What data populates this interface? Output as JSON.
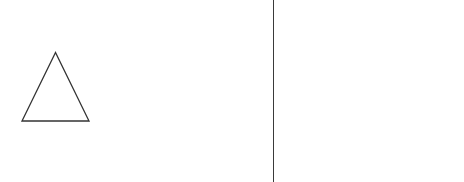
{
  "diagram": {
    "shapes": [
      {
        "type": "triangle",
        "name": "triangle",
        "points": [
          [
            55.5,
            52.5
          ],
          [
            22,
            121
          ],
          [
            89,
            121
          ]
        ],
        "stroke": "#333333",
        "stroke_width": 1.3,
        "fill": "none"
      }
    ],
    "divider": {
      "x": 273,
      "color": "#3a3a3a"
    },
    "background": "#ffffff"
  }
}
